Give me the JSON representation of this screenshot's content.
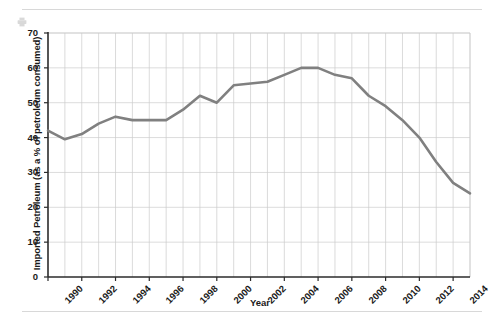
{
  "figure": {
    "background_color": "#ffffff",
    "rule_color": "#d8d8d8"
  },
  "icons": {
    "printer": "printer-icon"
  },
  "chart_data": {
    "type": "line",
    "title": "",
    "xlabel": "Year",
    "ylabel": "Imported Petroleum (as a % of petroleum consumed)",
    "xlim": [
      1990,
      2015
    ],
    "ylim": [
      0,
      70
    ],
    "ytick_values": [
      0,
      10,
      20,
      30,
      40,
      50,
      60,
      70
    ],
    "ytick_labels": [
      "0",
      "10",
      "20",
      "30",
      "40",
      "50",
      "60",
      "70"
    ],
    "xtick_values": [
      1990,
      1992,
      1994,
      1996,
      1998,
      2000,
      2002,
      2004,
      2006,
      2008,
      2010,
      2012,
      2014
    ],
    "xtick_labels": [
      "1990",
      "1992",
      "1994",
      "1996",
      "1998",
      "2000",
      "2002",
      "2004",
      "2006",
      "2008",
      "2010",
      "2012",
      "2014"
    ],
    "grid": true,
    "grid_color": "#cccccc",
    "legend": false,
    "line_color": "#808080",
    "line_width": 2.6,
    "x": [
      1990,
      1991,
      1992,
      1993,
      1994,
      1995,
      1996,
      1997,
      1998,
      1999,
      2000,
      2001,
      2002,
      2003,
      2004,
      2005,
      2006,
      2007,
      2008,
      2009,
      2010,
      2011,
      2012,
      2013,
      2014,
      2015
    ],
    "values": [
      42,
      39.5,
      41,
      44,
      46,
      45,
      45,
      45,
      48,
      52,
      50,
      55,
      55.5,
      56,
      58,
      60,
      60,
      58,
      57,
      52,
      49,
      45,
      40,
      33,
      27,
      24
    ]
  }
}
